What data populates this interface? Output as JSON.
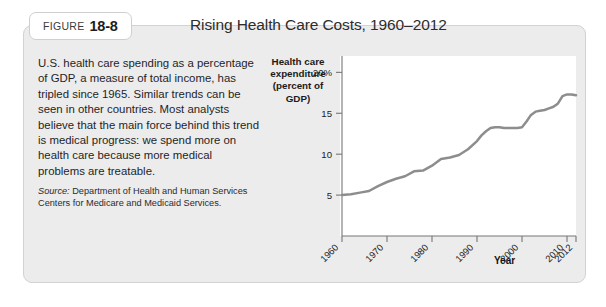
{
  "figure": {
    "label_word": "FIGURE",
    "number": "18-8",
    "title": "Rising Health Care Costs, 1960–2012"
  },
  "caption": {
    "body": "U.S. health care spending as a percentage of GDP, a measure of total income, has tripled since 1965. Similar trends can be seen in other countries. Most analysts believe that the main force behind this trend is medical progress: we spend more on health care because more medical problems are treatable.",
    "source_label": "Source:",
    "source_text": " Department of Health and Human Services Centers for Medicare and Medicaid Services."
  },
  "chart_data": {
    "type": "line",
    "title": "",
    "ylabel": "Health care expenditure (percent of GDP)",
    "ylabel_line1": "Health care",
    "ylabel_line2": "expenditure",
    "ylabel_line3": "(percent of GDP)",
    "xlabel": "Year",
    "ylim": [
      0,
      22
    ],
    "xlim": [
      1960,
      2012
    ],
    "ytick_values": [
      5,
      10,
      15,
      20
    ],
    "ytick_labels": [
      "5",
      "10",
      "15",
      "20%"
    ],
    "xtick_values": [
      1960,
      1970,
      1980,
      1990,
      2000,
      2010,
      2012
    ],
    "xtick_labels": [
      "1960",
      "1970",
      "1980",
      "1990",
      "2000",
      "2010",
      "2012"
    ],
    "grid": false,
    "legend": "none",
    "line_color": "#8d8d8d",
    "series": [
      {
        "name": "U.S. health care expenditure (percent of GDP)",
        "x": [
          1960,
          1962,
          1964,
          1966,
          1968,
          1970,
          1972,
          1974,
          1976,
          1978,
          1980,
          1982,
          1984,
          1986,
          1988,
          1990,
          1991,
          1992,
          1993,
          1994,
          1995,
          1996,
          1997,
          1998,
          1999,
          2000,
          2001,
          2002,
          2003,
          2004,
          2005,
          2006,
          2007,
          2008,
          2009,
          2010,
          2011,
          2012
        ],
        "values": [
          5.0,
          5.1,
          5.3,
          5.5,
          6.1,
          6.6,
          7.0,
          7.3,
          7.9,
          8.0,
          8.6,
          9.4,
          9.6,
          9.9,
          10.6,
          11.6,
          12.3,
          12.8,
          13.2,
          13.3,
          13.3,
          13.2,
          13.2,
          13.2,
          13.2,
          13.3,
          14.0,
          14.8,
          15.2,
          15.3,
          15.4,
          15.6,
          15.8,
          16.2,
          17.1,
          17.3,
          17.3,
          17.2
        ]
      }
    ]
  }
}
